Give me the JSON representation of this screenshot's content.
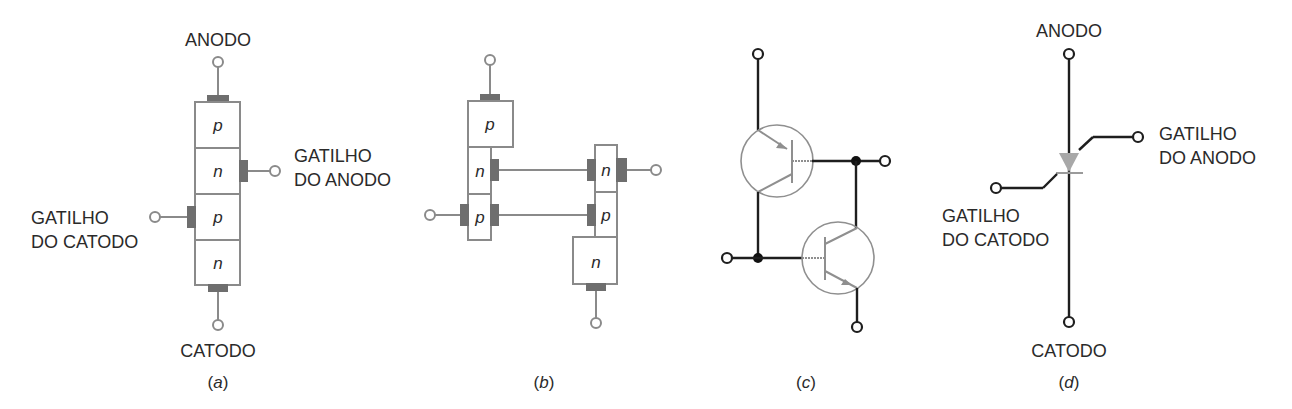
{
  "figure": {
    "panels": [
      {
        "id": "a",
        "caption": "(a)",
        "caption_letter": "a",
        "labels": {
          "top": "ANODO",
          "bottom": "CATODO",
          "right_line1": "GATILHO",
          "right_line2": "DO ANODO",
          "left_line1": "GATILHO",
          "left_line2": "DO CATODO"
        },
        "layers": [
          "p",
          "n",
          "p",
          "n"
        ]
      },
      {
        "id": "b",
        "caption": "(b)",
        "caption_letter": "b",
        "left_stack": [
          "p",
          "n",
          "p"
        ],
        "right_stack": [
          "n",
          "p",
          "n"
        ]
      },
      {
        "id": "c",
        "caption": "(c)",
        "caption_letter": "c",
        "description": "Two complementary transistors (PNP and NPN) interconnected"
      },
      {
        "id": "d",
        "caption": "(d)",
        "caption_letter": "d",
        "labels": {
          "top": "ANODO",
          "bottom": "CATODO",
          "right_line1": "GATILHO",
          "right_line2": "DO ANODO",
          "left_line1": "GATILHO",
          "left_line2": "DO CATODO"
        },
        "symbol": "silicon-controlled-switch"
      }
    ],
    "colors": {
      "gray_lines": "#8a8a8a",
      "dark_lines": "#1e1e1e",
      "pads": "#6e6e6e",
      "diode_fill": "#a8a8a8",
      "text": "#2a2a2a"
    }
  }
}
